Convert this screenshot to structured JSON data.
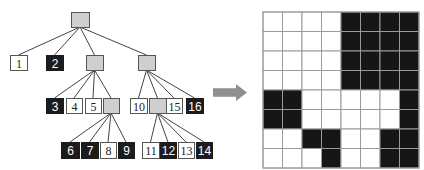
{
  "colors": {
    "black_node": "#1c1c1c",
    "white_node": "#ffffff",
    "gray_node": "#cfcfcf",
    "node_border": "#555555",
    "edge": "#444444",
    "arrow": "#8f8f8f",
    "grid_line": "#9a9a9a",
    "grid_black": "#161616",
    "grid_white": "#ffffff"
  },
  "tree": {
    "nodes": [
      {
        "id": "root",
        "label": "",
        "type": "gray",
        "x": 71,
        "y": 12,
        "w": 18,
        "h": 15
      },
      {
        "id": "n1",
        "label": "1",
        "type": "white",
        "x": 10,
        "y": 55,
        "w": 17,
        "h": 15
      },
      {
        "id": "n2",
        "label": "2",
        "type": "black",
        "x": 46,
        "y": 55,
        "w": 17,
        "h": 15
      },
      {
        "id": "g1",
        "label": "",
        "type": "gray",
        "x": 86,
        "y": 55,
        "w": 17,
        "h": 15
      },
      {
        "id": "g2",
        "label": "",
        "type": "gray",
        "x": 138,
        "y": 55,
        "w": 17,
        "h": 15
      },
      {
        "id": "n3",
        "label": "3",
        "type": "black",
        "x": 46,
        "y": 98,
        "w": 17,
        "h": 15
      },
      {
        "id": "n4",
        "label": "4",
        "type": "white",
        "x": 66,
        "y": 98,
        "w": 16,
        "h": 15
      },
      {
        "id": "n5",
        "label": "5",
        "type": "white",
        "x": 85,
        "y": 98,
        "w": 16,
        "h": 15
      },
      {
        "id": "g3",
        "label": "",
        "type": "gray",
        "x": 103,
        "y": 98,
        "w": 16,
        "h": 15
      },
      {
        "id": "n10",
        "label": "10",
        "type": "white",
        "x": 130,
        "y": 98,
        "w": 17,
        "h": 15
      },
      {
        "id": "g4",
        "label": "",
        "type": "gray",
        "x": 149,
        "y": 98,
        "w": 17,
        "h": 15
      },
      {
        "id": "n15",
        "label": "15",
        "type": "white",
        "x": 166,
        "y": 98,
        "w": 16,
        "h": 15
      },
      {
        "id": "n16",
        "label": "16",
        "type": "black",
        "x": 186,
        "y": 98,
        "w": 17,
        "h": 15
      },
      {
        "id": "n6",
        "label": "6",
        "type": "black",
        "x": 61,
        "y": 142,
        "w": 18,
        "h": 16
      },
      {
        "id": "n7",
        "label": "7",
        "type": "black",
        "x": 81,
        "y": 142,
        "w": 17,
        "h": 16
      },
      {
        "id": "n8",
        "label": "8",
        "type": "white",
        "x": 100,
        "y": 142,
        "w": 16,
        "h": 16
      },
      {
        "id": "n9",
        "label": "9",
        "type": "black",
        "x": 118,
        "y": 142,
        "w": 16,
        "h": 16
      },
      {
        "id": "n11",
        "label": "11",
        "type": "white",
        "x": 142,
        "y": 142,
        "w": 17,
        "h": 16
      },
      {
        "id": "n12",
        "label": "12",
        "type": "black",
        "x": 160,
        "y": 142,
        "w": 16,
        "h": 16
      },
      {
        "id": "n13",
        "label": "13",
        "type": "white",
        "x": 178,
        "y": 142,
        "w": 16,
        "h": 16
      },
      {
        "id": "n14",
        "label": "14",
        "type": "black",
        "x": 196,
        "y": 142,
        "w": 16,
        "h": 16
      }
    ],
    "edges": [
      [
        "root",
        "n1"
      ],
      [
        "root",
        "n2"
      ],
      [
        "root",
        "g1"
      ],
      [
        "root",
        "g2"
      ],
      [
        "g1",
        "n3"
      ],
      [
        "g1",
        "n4"
      ],
      [
        "g1",
        "n5"
      ],
      [
        "g1",
        "g3"
      ],
      [
        "g2",
        "n10"
      ],
      [
        "g2",
        "g4"
      ],
      [
        "g2",
        "n15"
      ],
      [
        "g2",
        "n16"
      ],
      [
        "g3",
        "n6"
      ],
      [
        "g3",
        "n7"
      ],
      [
        "g3",
        "n8"
      ],
      [
        "g3",
        "n9"
      ],
      [
        "g4",
        "n11"
      ],
      [
        "g4",
        "n12"
      ],
      [
        "g4",
        "n13"
      ],
      [
        "g4",
        "n14"
      ]
    ]
  },
  "arrow": {
    "x": 213,
    "y": 84,
    "w": 34,
    "h": 17,
    "direction": "right"
  },
  "grid": {
    "x": 263,
    "y": 12,
    "cell": 19.5,
    "rows": 8,
    "cols": 8,
    "cells": [
      [
        0,
        0,
        0,
        0,
        1,
        1,
        1,
        1
      ],
      [
        0,
        0,
        0,
        0,
        1,
        1,
        1,
        1
      ],
      [
        0,
        0,
        0,
        0,
        1,
        1,
        1,
        1
      ],
      [
        0,
        0,
        0,
        0,
        1,
        1,
        1,
        1
      ],
      [
        1,
        1,
        0,
        0,
        0,
        0,
        0,
        1
      ],
      [
        1,
        1,
        0,
        0,
        0,
        0,
        0,
        1
      ],
      [
        0,
        0,
        1,
        1,
        0,
        0,
        1,
        1
      ],
      [
        0,
        0,
        0,
        1,
        0,
        0,
        1,
        1
      ]
    ]
  }
}
